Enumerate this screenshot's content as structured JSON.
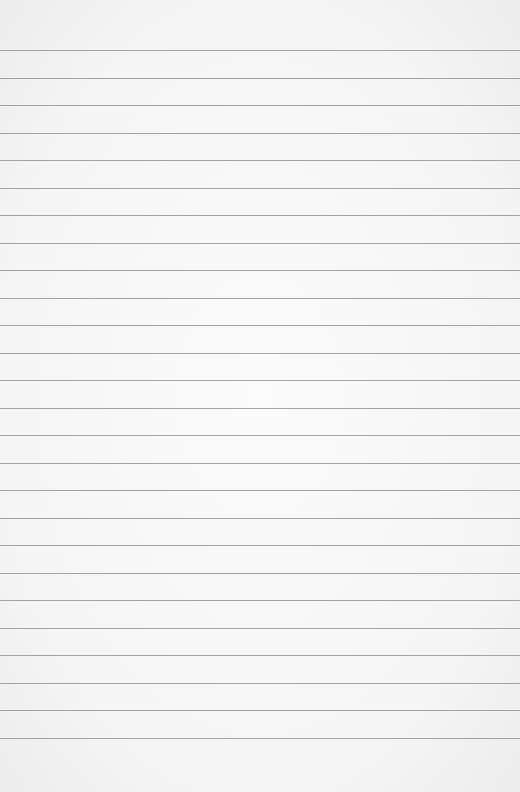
{
  "paper": {
    "type": "lined-paper",
    "line_count": 26,
    "first_line_y": 50,
    "line_spacing": 27.52,
    "line_color": "#a3a3a3",
    "background_color": "#f6f6f6"
  }
}
